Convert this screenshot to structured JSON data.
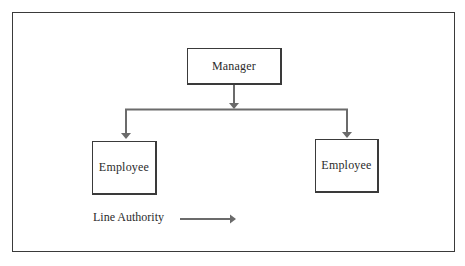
{
  "diagram": {
    "type": "org-chart",
    "nodes": [
      {
        "id": "manager",
        "label": "Manager"
      },
      {
        "id": "employee_left",
        "label": "Employee"
      },
      {
        "id": "employee_right",
        "label": "Employee"
      }
    ],
    "edges": [
      {
        "from": "manager",
        "to": "employee_left",
        "kind": "line-authority"
      },
      {
        "from": "manager",
        "to": "employee_right",
        "kind": "line-authority"
      }
    ],
    "legend": {
      "label": "Line Authority",
      "symbol": "arrow-right"
    },
    "colors": {
      "line": "#6b6b6b",
      "border": "#3a3a3a",
      "text": "#2b2b2b"
    }
  }
}
